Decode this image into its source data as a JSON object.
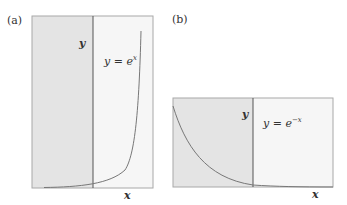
{
  "panels": [
    {
      "label": "(a)",
      "y_axis_label": "y",
      "x_axis_label": "x",
      "equation": "y = e",
      "exponent": "x",
      "function": "exponential growth"
    },
    {
      "label": "(b)",
      "y_axis_label": "y",
      "x_axis_label": "x",
      "equation": "y = e",
      "exponent": "−x",
      "function": "exponential decay"
    }
  ],
  "colors": {
    "shaded": "#e4e4e4",
    "light": "#f6f6f6",
    "border": "#a8a8a8",
    "axis": "#555555",
    "curve": "#777777"
  }
}
